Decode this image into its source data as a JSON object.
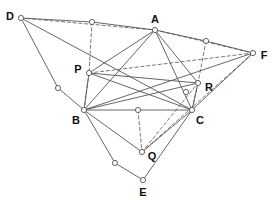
{
  "figure": {
    "title": "",
    "width": 272,
    "height": 200,
    "background_color": "#ffffff",
    "stroke_color": "#555555",
    "node_fill_color": "#ffffff",
    "label_color": "#111111"
  },
  "chart_data": {
    "type": "diagram",
    "title": "",
    "xlabel": "",
    "ylabel": "",
    "labeled_points": [
      {
        "id": "D",
        "label": "D",
        "x": 21,
        "y": 18,
        "label_dx": -11,
        "label_dy": -2
      },
      {
        "id": "A",
        "label": "A",
        "x": 155,
        "y": 30,
        "label_dx": 0,
        "label_dy": -11
      },
      {
        "id": "F",
        "label": "F",
        "x": 253,
        "y": 53,
        "label_dx": 11,
        "label_dy": 2
      },
      {
        "id": "P",
        "label": "P",
        "x": 89,
        "y": 73,
        "label_dx": -11,
        "label_dy": -4
      },
      {
        "id": "R",
        "label": "R",
        "x": 198,
        "y": 83,
        "label_dx": 11,
        "label_dy": 4
      },
      {
        "id": "B",
        "label": "B",
        "x": 84,
        "y": 110,
        "label_dx": -8,
        "label_dy": 10
      },
      {
        "id": "C",
        "label": "C",
        "x": 192,
        "y": 110,
        "label_dx": 8,
        "label_dy": 10
      },
      {
        "id": "Q",
        "label": "Q",
        "x": 142,
        "y": 152,
        "label_dx": 10,
        "label_dy": 4
      },
      {
        "id": "E",
        "label": "E",
        "x": 143,
        "y": 180,
        "label_dx": 0,
        "label_dy": 12
      }
    ],
    "unlabeled_points": [
      {
        "id": "M_DA",
        "label": "",
        "x": 92,
        "y": 22
      },
      {
        "id": "M_AF",
        "label": "",
        "x": 206,
        "y": 41
      },
      {
        "id": "M_DB",
        "label": "",
        "x": 58,
        "y": 88
      },
      {
        "id": "M_RC",
        "label": "",
        "x": 186,
        "y": 92
      },
      {
        "id": "M_BC",
        "label": "",
        "x": 138,
        "y": 110
      },
      {
        "id": "M_BE",
        "label": "",
        "x": 115,
        "y": 163
      }
    ],
    "solid_segments": [
      [
        "D",
        "M_DA"
      ],
      [
        "M_DA",
        "A"
      ],
      [
        "A",
        "M_AF"
      ],
      [
        "M_AF",
        "F"
      ],
      [
        "D",
        "M_DB"
      ],
      [
        "M_DB",
        "B"
      ],
      [
        "B",
        "M_BE"
      ],
      [
        "M_BE",
        "E"
      ],
      [
        "F",
        "C"
      ],
      [
        "C",
        "E"
      ],
      [
        "A",
        "P"
      ],
      [
        "A",
        "B"
      ],
      [
        "A",
        "C"
      ],
      [
        "A",
        "R"
      ],
      [
        "P",
        "R"
      ],
      [
        "P",
        "B"
      ],
      [
        "R",
        "C"
      ],
      [
        "B",
        "M_BC"
      ],
      [
        "M_BC",
        "C"
      ],
      [
        "P",
        "C"
      ],
      [
        "B",
        "R"
      ],
      [
        "B",
        "Q"
      ],
      [
        "C",
        "Q"
      ],
      [
        "D",
        "C"
      ],
      [
        "F",
        "B"
      ]
    ],
    "dashed_segments": [
      [
        "M_DA",
        "P"
      ],
      [
        "P",
        "B"
      ],
      [
        "M_AF",
        "R"
      ],
      [
        "R",
        "C"
      ],
      [
        "M_BC",
        "Q"
      ],
      [
        "D",
        "A"
      ],
      [
        "A",
        "F"
      ],
      [
        "P",
        "F"
      ],
      [
        "Q",
        "F"
      ],
      [
        "Q",
        "R"
      ]
    ]
  }
}
